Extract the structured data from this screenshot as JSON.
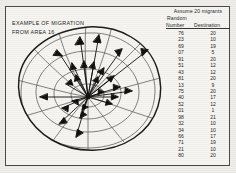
{
  "figure": {
    "caption_line1": "EXAMPLE OF MIGRATION",
    "caption_line2": "FROM AREA  16",
    "origin_area": "16"
  },
  "table": {
    "assume_line": "Assume 20 migrants",
    "random_label": "Random",
    "columns": [
      "Number",
      "Destination"
    ],
    "rows": [
      {
        "number": "76",
        "destination": "20"
      },
      {
        "number": "23",
        "destination": "10"
      },
      {
        "number": "69",
        "destination": "19"
      },
      {
        "number": "07",
        "destination": "5"
      },
      {
        "number": "91",
        "destination": "20"
      },
      {
        "number": "51",
        "destination": "12"
      },
      {
        "number": "43",
        "destination": "12"
      },
      {
        "number": "81",
        "destination": "20"
      },
      {
        "number": "13",
        "destination": "9"
      },
      {
        "number": "75",
        "destination": "20"
      },
      {
        "number": "40",
        "destination": "17"
      },
      {
        "number": "52",
        "destination": "12"
      },
      {
        "number": "01",
        "destination": "1"
      },
      {
        "number": "98",
        "destination": "21"
      },
      {
        "number": "32",
        "destination": "10"
      },
      {
        "number": "34",
        "destination": "10"
      },
      {
        "number": "66",
        "destination": "17"
      },
      {
        "number": "71",
        "destination": "19"
      },
      {
        "number": "21",
        "destination": "10"
      },
      {
        "number": "80",
        "destination": "20"
      }
    ]
  },
  "colors": {
    "ink": "#1d1d1c",
    "paper": "#f6f5f2",
    "grid_line": "#5a5a56",
    "outline": "#1c1c1a"
  },
  "map": {
    "origin_x": 88,
    "origin_y": 97,
    "arrow_count": 20,
    "description": "distorted-grid-mental-map-with-migration-vectors"
  }
}
